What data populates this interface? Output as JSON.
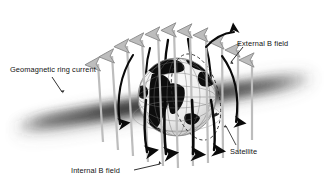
{
  "figure": {
    "type": "diagram",
    "background_color": "#ffffff",
    "width": 326,
    "height": 186
  },
  "labels": {
    "ring_current": "Geomagnetic ring current",
    "external_b_field": "External B field",
    "internal_b_field": "Internal B field",
    "satellite": "Satellite"
  },
  "elements": {
    "globe": {
      "name": "earth-globe",
      "center_x": 177,
      "center_y": 97,
      "radius": 39,
      "graticule": true,
      "land_color": "#0d0d0d",
      "ocean_color": "#f2f2f2"
    },
    "ring_current_band": {
      "name": "ring-current-band",
      "color": "#3a3a3a",
      "blur": true,
      "orientation": "diagonal",
      "left_x": 12,
      "right_x": 316,
      "left_y": 120,
      "right_y": 72
    },
    "external_field_arrows": {
      "name": "external-field-arrow",
      "color": "#b9b9b9",
      "outline_color": "#9a9a9a",
      "direction": "up",
      "count": 13
    },
    "internal_field_lines": {
      "name": "internal-field-line",
      "color": "#0a0a0a",
      "direction": "down-outward",
      "count": 8
    },
    "satellite_orbit": {
      "name": "satellite-orbit",
      "style": "dashed",
      "color": "#2a2a2a"
    },
    "satellite_marker": {
      "name": "satellite-marker",
      "color": "#2a2a2a"
    }
  },
  "colors": {
    "ink": "#121212",
    "gray_arrow": "#b9b9b9",
    "black_arrow": "#0a0a0a",
    "band": "#3a3a3a"
  }
}
